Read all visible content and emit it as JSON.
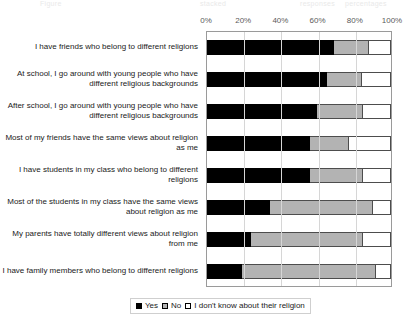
{
  "ghost": {
    "fragments": [
      "Figure",
      "stacked",
      "responses",
      "percentages"
    ]
  },
  "chart_data": {
    "type": "bar",
    "orientation": "horizontal",
    "stacked": true,
    "stack_mode": "percent",
    "title": "",
    "subtitle": "",
    "xlabel": "",
    "ylabel": "",
    "xlim": [
      0,
      100
    ],
    "xticks": [
      0,
      20,
      40,
      60,
      80,
      100
    ],
    "xtick_labels": [
      "0%",
      "20%",
      "40%",
      "60%",
      "80%",
      "100%"
    ],
    "grid": true,
    "grid_axis": "x",
    "legend_position": "bottom",
    "categories": [
      "I have friends who belong to different religions",
      "At school, I go around with young people who have different religious backgrounds",
      "After school, I go around with young people who have different religious backgrounds",
      "Most of my friends have the same views about religion as me",
      "I have students in my class who belong to different religions",
      "Most of the students in my class have the same views about religion as me",
      "My parents have totally different views about religion from me",
      "I have family members who belong to different religions"
    ],
    "series": [
      {
        "name": "Yes",
        "color": "#000000",
        "values": [
          69,
          65,
          60,
          56,
          56,
          34,
          24,
          19
        ]
      },
      {
        "name": "No",
        "color": "#b3b3b3",
        "values": [
          19,
          19,
          25,
          21,
          29,
          56,
          61,
          73
        ]
      },
      {
        "name": "I don't know  about their religion",
        "color": "#ffffff",
        "values": [
          12,
          16,
          15,
          23,
          15,
          10,
          15,
          8
        ]
      }
    ]
  },
  "legend": {
    "items": [
      {
        "label": "Yes",
        "swatch": "yes"
      },
      {
        "label": "No",
        "swatch": "no"
      },
      {
        "label": "I don't know  about their religion",
        "swatch": "dk"
      }
    ]
  },
  "colors": {
    "yes": "#000000",
    "no": "#b3b3b3",
    "dont_know": "#ffffff",
    "frame": "#9a9a9a",
    "gridline": "#d6d6d6",
    "tick_text": "#5b5b5b",
    "label_text": "#1a1a1a",
    "background": "#ffffff"
  }
}
